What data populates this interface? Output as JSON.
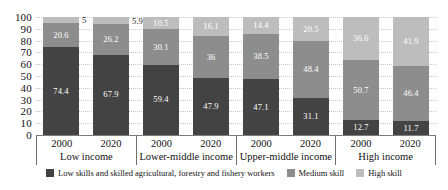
{
  "chart_data": {
    "type": "bar",
    "stacked": true,
    "title": "",
    "subtitle": "",
    "xlabel": "",
    "ylabel": "",
    "ylim": [
      0,
      100
    ],
    "yticks": [
      100,
      90,
      80,
      70,
      60,
      50,
      40,
      30,
      20,
      10,
      0
    ],
    "grid": true,
    "legend_position": "bottom",
    "groups": [
      {
        "name": "Low income",
        "bars": [
          {
            "year": "2000",
            "segments": [
              {
                "series": "Low skills and skilled agricultural, forestry and fishery workers",
                "value": 74.4,
                "label": "74.4",
                "label_outside": false
              },
              {
                "series": "Medium skill",
                "value": 20.6,
                "label": "20.6",
                "label_outside": false
              },
              {
                "series": "High skill",
                "value": 5,
                "label": "5",
                "label_outside": true
              }
            ]
          },
          {
            "year": "2020",
            "segments": [
              {
                "series": "Low skills and skilled agricultural, forestry and fishery workers",
                "value": 67.9,
                "label": "67.9",
                "label_outside": false
              },
              {
                "series": "Medium skill",
                "value": 26.2,
                "label": "26.2",
                "label_outside": false
              },
              {
                "series": "High skill",
                "value": 5.9,
                "label": "5.9",
                "label_outside": true
              }
            ]
          }
        ]
      },
      {
        "name": "Lower-middle income",
        "bars": [
          {
            "year": "2000",
            "segments": [
              {
                "series": "Low skills and skilled agricultural, forestry and fishery workers",
                "value": 59.4,
                "label": "59.4",
                "label_outside": false
              },
              {
                "series": "Medium skill",
                "value": 30.1,
                "label": "30.1",
                "label_outside": false
              },
              {
                "series": "High skill",
                "value": 10.5,
                "label": "10.5",
                "label_outside": false
              }
            ]
          },
          {
            "year": "2020",
            "segments": [
              {
                "series": "Low skills and skilled agricultural, forestry and fishery workers",
                "value": 47.9,
                "label": "47.9",
                "label_outside": false
              },
              {
                "series": "Medium skill",
                "value": 36,
                "label": "36",
                "label_outside": false
              },
              {
                "series": "High skill",
                "value": 16.1,
                "label": "16.1",
                "label_outside": false
              }
            ]
          }
        ]
      },
      {
        "name": "Upper-middle income",
        "bars": [
          {
            "year": "2000",
            "segments": [
              {
                "series": "Low skills and skilled agricultural, forestry and fishery workers",
                "value": 47.1,
                "label": "47.1",
                "label_outside": false
              },
              {
                "series": "Medium skill",
                "value": 38.5,
                "label": "38.5",
                "label_outside": false
              },
              {
                "series": "High skill",
                "value": 14.4,
                "label": "14.4",
                "label_outside": false
              }
            ]
          },
          {
            "year": "2020",
            "segments": [
              {
                "series": "Low skills and skilled agricultural, forestry and fishery workers",
                "value": 31.1,
                "label": "31.1",
                "label_outside": false
              },
              {
                "series": "Medium skill",
                "value": 48.4,
                "label": "48.4",
                "label_outside": false
              },
              {
                "series": "High skill",
                "value": 20.5,
                "label": "20.5",
                "label_outside": false
              }
            ]
          }
        ]
      },
      {
        "name": "High income",
        "bars": [
          {
            "year": "2000",
            "segments": [
              {
                "series": "Low skills and skilled agricultural, forestry and fishery workers",
                "value": 12.7,
                "label": "12.7",
                "label_outside": false
              },
              {
                "series": "Medium skill",
                "value": 50.7,
                "label": "50.7",
                "label_outside": false
              },
              {
                "series": "High skill",
                "value": 36.6,
                "label": "36.6",
                "label_outside": false
              }
            ]
          },
          {
            "year": "2020",
            "segments": [
              {
                "series": "Low skills and skilled agricultural, forestry and fishery workers",
                "value": 11.7,
                "label": "11.7",
                "label_outside": false
              },
              {
                "series": "Medium skill",
                "value": 46.4,
                "label": "46.4",
                "label_outside": false
              },
              {
                "series": "High skill",
                "value": 41.9,
                "label": "41.9",
                "label_outside": false
              }
            ]
          }
        ]
      }
    ],
    "legend": [
      {
        "label": "Low skills and skilled agricultural, forestry and fishery workers",
        "color": "#434343",
        "key": "low"
      },
      {
        "label": "Medium skill",
        "color": "#8d8d8d",
        "key": "med"
      },
      {
        "label": "High skill",
        "color": "#bdbdbd",
        "key": "high"
      }
    ],
    "colors": {
      "low": "#434343",
      "medium": "#8d8d8d",
      "high": "#bdbdbd",
      "axis": "#6f6f6f",
      "gridline": "#c9c9c9",
      "text": "#111111"
    }
  }
}
